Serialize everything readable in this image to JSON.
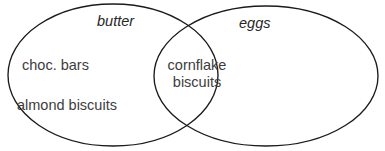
{
  "diagram": {
    "type": "venn",
    "background_color": "#ffffff",
    "stroke_color": "#1b1b1b",
    "text_color": "#3d3d3d",
    "sets": [
      {
        "id": "butter",
        "label": "butter",
        "position": "left",
        "center_x": 113,
        "center_y": 75,
        "radius_x": 105,
        "radius_y": 71
      },
      {
        "id": "eggs",
        "label": "eggs",
        "position": "right",
        "center_x": 266,
        "center_y": 76,
        "radius_x": 112,
        "radius_y": 70
      }
    ],
    "regions": {
      "left_only": {
        "set": "butter",
        "items": [
          "choc. bars",
          "almond biscuits"
        ]
      },
      "intersection": {
        "sets": [
          "butter",
          "eggs"
        ],
        "items_lines": [
          "cornflake",
          "biscuits"
        ],
        "item": "cornflake biscuits"
      },
      "right_only": {
        "set": "eggs",
        "items": []
      }
    }
  }
}
